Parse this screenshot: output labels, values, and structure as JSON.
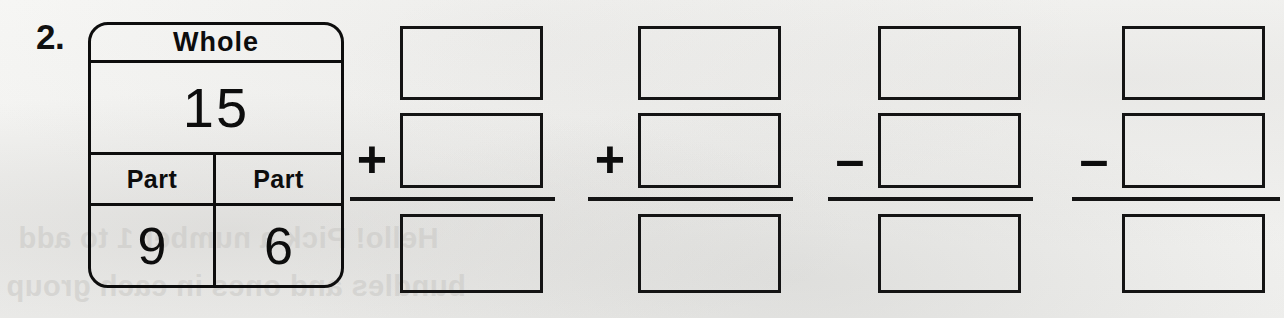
{
  "problem": {
    "number": "2."
  },
  "part_whole": {
    "whole_label": "Whole",
    "whole_value": "15",
    "part_label_left": "Part",
    "part_label_right": "Part",
    "part_value_left": "9",
    "part_value_right": "6"
  },
  "columns": [
    {
      "operator": "+",
      "operator_name": "plus",
      "top_value": "",
      "middle_value": "",
      "bottom_value": ""
    },
    {
      "operator": "+",
      "operator_name": "plus",
      "top_value": "",
      "middle_value": "",
      "bottom_value": ""
    },
    {
      "operator": "–",
      "operator_name": "minus",
      "top_value": "",
      "middle_value": "",
      "bottom_value": ""
    },
    {
      "operator": "–",
      "operator_name": "minus",
      "top_value": "",
      "middle_value": "",
      "bottom_value": ""
    }
  ],
  "bleed_through": {
    "line_1": "Hello! Pick a number 1 to add",
    "line_2": "bundles and ones in each group"
  },
  "colors": {
    "ink": "#0d0d0d",
    "paper": "#f4f4f2",
    "bleed": "#c9c8c5"
  }
}
